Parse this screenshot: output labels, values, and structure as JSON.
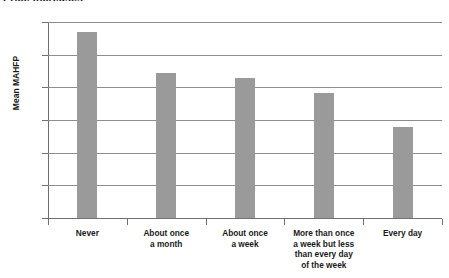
{
  "chart_data": {
    "type": "bar",
    "title": "Price increases",
    "xlabel": "",
    "ylabel": "Mean MAHFP",
    "categories": [
      "Never",
      "About once a month",
      "About once a week",
      "More than once a week but less than every day of the week",
      "Every day"
    ],
    "category_lines": [
      [
        "Never"
      ],
      [
        "About once",
        "a month"
      ],
      [
        "About once",
        "a week"
      ],
      [
        "More than once",
        "a week but less",
        "than every day",
        "of the week"
      ],
      [
        "Every day"
      ]
    ],
    "values": [
      11.4,
      8.9,
      8.55,
      7.65,
      5.6
    ],
    "ylim": [
      0,
      12
    ],
    "ytick_values": [
      0,
      2,
      4,
      6,
      8,
      10,
      12
    ],
    "ytick_labels": [
      "0",
      "2",
      "4",
      "6",
      "8",
      "10",
      "12"
    ],
    "grid": "horizontal",
    "legend": "none",
    "bar_color": "#9a9a9a",
    "axis_color": "#6f6f6f",
    "grid_color": "#8d8d8d"
  }
}
